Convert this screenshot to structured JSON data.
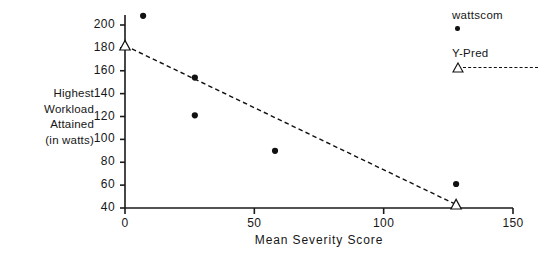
{
  "chart_data": {
    "type": "scatter",
    "title": "",
    "xlabel": "Mean Severity Score",
    "ylabel": "Highest Workload Attained (in watts)",
    "ylabel_lines": [
      "Highest",
      "Workload",
      "Attained",
      "(in watts)"
    ],
    "xlim": [
      0,
      150
    ],
    "ylim": [
      40,
      210
    ],
    "xticks": [
      0,
      50,
      100,
      150
    ],
    "xtick_labels": [
      "0",
      "50",
      "100",
      "150"
    ],
    "yticks": [
      40,
      60,
      80,
      100,
      120,
      140,
      160,
      180,
      200
    ],
    "ytick_labels": [
      "40",
      "60",
      "80",
      "100",
      "120",
      "140",
      "160",
      "180",
      "200"
    ],
    "grid": false,
    "legend_position": "top-right",
    "series": [
      {
        "name": "wattscom",
        "marker": "filled-circle",
        "line": "none",
        "color": "#111111",
        "points": [
          {
            "x": 7,
            "y": 208
          },
          {
            "x": 27,
            "y": 154
          },
          {
            "x": 27,
            "y": 121
          },
          {
            "x": 58,
            "y": 90
          },
          {
            "x": 128,
            "y": 61
          }
        ]
      },
      {
        "name": "Y-Pred",
        "marker": "open-triangle",
        "line": "dashed",
        "color": "#111111",
        "points": [
          {
            "x": 0,
            "y": 182
          },
          {
            "x": 128,
            "y": 43
          }
        ]
      }
    ]
  },
  "legend": {
    "entries": [
      {
        "label": "wattscom",
        "marker": "filled-circle-marker"
      },
      {
        "label": "Y-Pred",
        "marker": "open-triangle-dashed-marker"
      }
    ]
  },
  "axes": {
    "x_title": "Mean Severity Score",
    "y_title_lines": [
      "Highest",
      "Workload",
      "Attained",
      "(in watts)"
    ]
  },
  "colors": {
    "marker": "#111111",
    "axis": "#1a1a1a",
    "background": "#ffffff"
  }
}
